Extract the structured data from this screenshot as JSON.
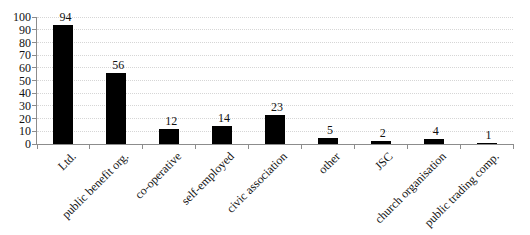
{
  "chart_data": {
    "type": "bar",
    "title": "",
    "xlabel": "",
    "ylabel": "",
    "categories": [
      "Ltd.",
      "public benefit org.",
      "co-operative",
      "self-employed",
      "civic association",
      "other",
      "JSC",
      "church organisation",
      "public trading comp."
    ],
    "values": [
      94,
      56,
      12,
      14,
      23,
      5,
      2,
      4,
      1
    ],
    "value_labels": [
      "94",
      "56",
      "12",
      "14",
      "23",
      "5",
      "2",
      "4",
      "1"
    ],
    "ylim": [
      0,
      100
    ],
    "yticks": [
      0,
      10,
      20,
      30,
      40,
      50,
      60,
      70,
      80,
      90,
      100
    ],
    "grid": "horizontal-dotted",
    "legend": "none",
    "x_tick_label_rotation_deg": 45,
    "bar_color": "#000000",
    "axis_color": "#8c8c8c",
    "gridline_color": "#d6d6d6",
    "text_color": "#111111",
    "background_color": "#ffffff"
  }
}
